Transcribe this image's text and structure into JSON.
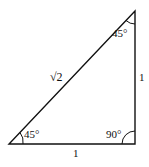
{
  "diagram": {
    "type": "right-triangle",
    "angles": {
      "top": "45°",
      "bottom_left": "45°",
      "bottom_right": "90°"
    },
    "sides": {
      "hypotenuse": "√2",
      "vertical": "1",
      "horizontal": "1"
    },
    "colors": {
      "line": "#111111",
      "background": "#ffffff"
    }
  }
}
